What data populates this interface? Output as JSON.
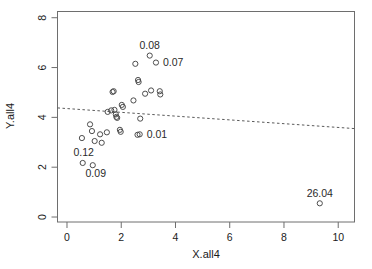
{
  "chart_data": {
    "type": "scatter",
    "title": "",
    "xlabel": "X.all4",
    "ylabel": "Y.all4",
    "xlim": [
      -0.35,
      10.6
    ],
    "ylim": [
      -0.2,
      8.25
    ],
    "xticks": [
      0,
      2,
      4,
      6,
      8,
      10
    ],
    "yticks": [
      0,
      2,
      4,
      6,
      8
    ],
    "grid": false,
    "legend": "none",
    "points": [
      {
        "x": 0.55,
        "y": 3.17,
        "label": ""
      },
      {
        "x": 0.58,
        "y": 2.17,
        "label": "0.12",
        "label_pos": "above-left"
      },
      {
        "x": 0.85,
        "y": 3.72,
        "label": ""
      },
      {
        "x": 0.92,
        "y": 3.45,
        "label": ""
      },
      {
        "x": 0.95,
        "y": 2.08,
        "label": "0.09",
        "label_pos": "below-right"
      },
      {
        "x": 1.02,
        "y": 3.05,
        "label": ""
      },
      {
        "x": 1.22,
        "y": 3.32,
        "label": ""
      },
      {
        "x": 1.28,
        "y": 2.98,
        "label": ""
      },
      {
        "x": 1.47,
        "y": 3.4,
        "label": ""
      },
      {
        "x": 1.5,
        "y": 4.22,
        "label": ""
      },
      {
        "x": 1.63,
        "y": 4.28,
        "label": ""
      },
      {
        "x": 1.68,
        "y": 5.02,
        "label": ""
      },
      {
        "x": 1.72,
        "y": 5.05,
        "label": ""
      },
      {
        "x": 1.75,
        "y": 4.3,
        "label": ""
      },
      {
        "x": 1.8,
        "y": 4.12,
        "label": ""
      },
      {
        "x": 1.82,
        "y": 4.02,
        "label": ""
      },
      {
        "x": 1.85,
        "y": 3.98,
        "label": ""
      },
      {
        "x": 1.95,
        "y": 3.5,
        "label": ""
      },
      {
        "x": 1.98,
        "y": 3.42,
        "label": ""
      },
      {
        "x": 2.02,
        "y": 4.5,
        "label": ""
      },
      {
        "x": 2.06,
        "y": 4.42,
        "label": ""
      },
      {
        "x": 2.45,
        "y": 4.68,
        "label": ""
      },
      {
        "x": 2.52,
        "y": 6.15,
        "label": ""
      },
      {
        "x": 2.6,
        "y": 3.3,
        "label": ""
      },
      {
        "x": 2.62,
        "y": 5.5,
        "label": ""
      },
      {
        "x": 2.64,
        "y": 5.42,
        "label": ""
      },
      {
        "x": 2.7,
        "y": 3.95,
        "label": ""
      },
      {
        "x": 2.88,
        "y": 4.95,
        "label": ""
      },
      {
        "x": 3.05,
        "y": 6.48,
        "label": "0.08",
        "label_pos": "above"
      },
      {
        "x": 3.1,
        "y": 5.08,
        "label": ""
      },
      {
        "x": 3.28,
        "y": 6.2,
        "label": "0.07",
        "label_pos": "right"
      },
      {
        "x": 3.42,
        "y": 5.05,
        "label": ""
      },
      {
        "x": 3.44,
        "y": 4.92,
        "label": ""
      },
      {
        "x": 2.68,
        "y": 3.32,
        "label": "0.01",
        "label_pos": "right"
      },
      {
        "x": 9.32,
        "y": 0.55,
        "label": "26.04",
        "label_pos": "above"
      }
    ],
    "fit_line": {
      "style": "dashed",
      "x_start": -0.35,
      "y_start": 4.38,
      "x_end": 10.6,
      "y_end": 3.55
    }
  }
}
